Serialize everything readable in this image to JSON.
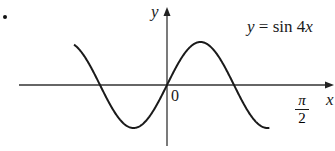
{
  "figure": {
    "marker": "•",
    "title": "y = sin 4x",
    "y_axis_label": "y",
    "x_axis_label": "x",
    "origin_label": "0",
    "tick_label": {
      "numerator": "π",
      "denominator": "2"
    }
  },
  "chart_data": {
    "type": "line",
    "title": "y = sin 4x",
    "xlabel": "x",
    "ylabel": "y",
    "function": "sin(4x)",
    "x_ticks": [
      {
        "value": 0,
        "label": "0"
      },
      {
        "value": 1.5708,
        "label": "π/2"
      }
    ],
    "x_range": [
      -1.09,
      1.2
    ],
    "y_range": [
      -1,
      1
    ],
    "series": [
      {
        "name": "y = sin 4x",
        "x": [
          -1.0873,
          -0.9817,
          -0.7854,
          -0.589,
          -0.3927,
          -0.1963,
          0,
          0.1963,
          0.3927,
          0.589,
          0.7854,
          0.9817,
          1.1781,
          1.2
        ],
        "y": [
          -0.58,
          0.71,
          0.0,
          -1.0,
          0.0,
          -1.0,
          0,
          1.0,
          0.0,
          -1.0,
          0.0,
          1.0,
          0.0,
          0.8
        ]
      }
    ],
    "grid": false,
    "legend": "none",
    "annotations": [
      "y = sin 4x label at upper right"
    ]
  },
  "colors": {
    "line": "#1a1a1a",
    "axis": "#333333",
    "background": "#ffffff"
  }
}
